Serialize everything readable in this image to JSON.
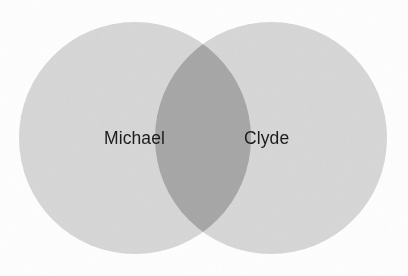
{
  "figure": {
    "type": "venn-diagram",
    "background_color": "#ffffff",
    "width": 408,
    "height": 276
  },
  "chart_data": {
    "type": "venn",
    "title": "",
    "sets": [
      {
        "id": "left",
        "label": "Michael",
        "fill_color": "#d8d8d8",
        "center_x": 135,
        "center_y": 138,
        "radius": 116
      },
      {
        "id": "right",
        "label": "Clyde",
        "fill_color": "#d8d8d8",
        "center_x": 271,
        "center_y": 138,
        "radius": 116
      }
    ],
    "intersection": {
      "label": "",
      "fill_color": "#a8a8a8",
      "left_x": 155,
      "right_x": 251,
      "top_y": 33,
      "bottom_y": 242
    },
    "label_color": "#1c1c1c",
    "legend": "none",
    "grid": false
  },
  "labels": {
    "left_set": "Michael",
    "right_set": "Clyde"
  },
  "colors": {
    "circle_fill": "#d8d8d8",
    "overlap_fill": "#a8a8a8",
    "background": "#ffffff",
    "text": "#1c1c1c"
  }
}
